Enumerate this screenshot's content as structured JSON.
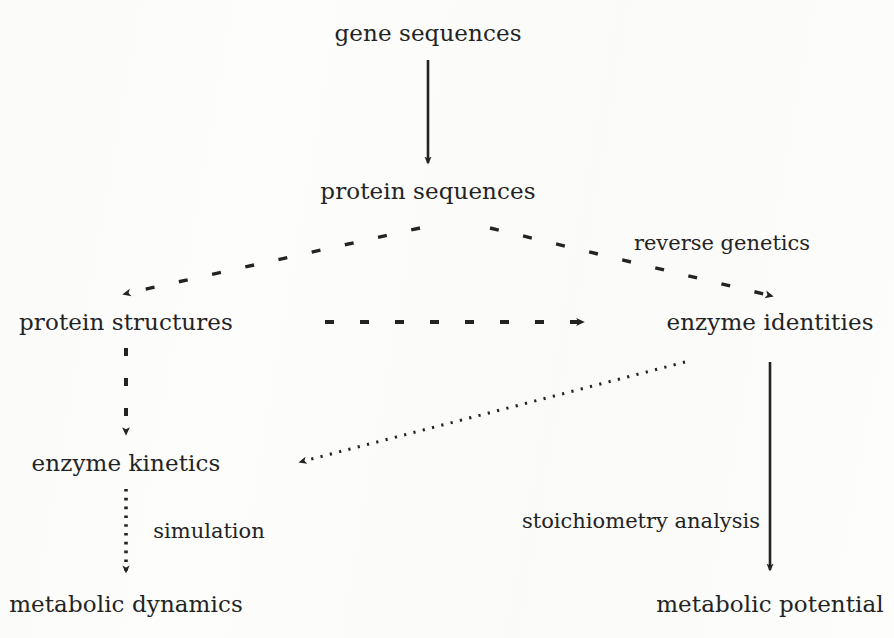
{
  "diagram": {
    "background_color": "#fdfdfc",
    "ink_color": "#232323",
    "nodes": [
      {
        "id": "gene_sequences",
        "label": "gene sequences",
        "x": 428,
        "y": 33
      },
      {
        "id": "protein_sequences",
        "label": "protein sequences",
        "x": 428,
        "y": 191
      },
      {
        "id": "protein_structures",
        "label": "protein structures",
        "x": 126,
        "y": 322
      },
      {
        "id": "enzyme_identities",
        "label": "enzyme identities",
        "x": 770,
        "y": 322
      },
      {
        "id": "enzyme_kinetics",
        "label": "enzyme kinetics",
        "x": 126,
        "y": 463
      },
      {
        "id": "metabolic_dynamics",
        "label": "metabolic dynamics",
        "x": 126,
        "y": 604
      },
      {
        "id": "metabolic_potential",
        "label": "metabolic potential",
        "x": 770,
        "y": 604
      }
    ],
    "edge_labels": [
      {
        "id": "reverse_genetics",
        "label": "reverse genetics",
        "x": 722,
        "y": 243
      },
      {
        "id": "simulation",
        "label": "simulation",
        "x": 209,
        "y": 531
      },
      {
        "id": "stoichiometry_analysis",
        "label": "stoichiometry analysis",
        "x": 641,
        "y": 521
      }
    ],
    "edges": [
      {
        "id": "gene-to-protein",
        "from": "gene_sequences",
        "to": "protein_sequences",
        "style": "solid"
      },
      {
        "id": "protein-to-structures",
        "from": "protein_sequences",
        "to": "protein_structures",
        "style": "dashed"
      },
      {
        "id": "protein-to-enzymes",
        "from": "protein_sequences",
        "to": "enzyme_identities",
        "style": "dashed"
      },
      {
        "id": "structures-to-enzymes",
        "from": "protein_structures",
        "to": "enzyme_identities",
        "style": "dashed"
      },
      {
        "id": "structures-to-kinetics",
        "from": "protein_structures",
        "to": "enzyme_kinetics",
        "style": "dashed"
      },
      {
        "id": "enzymes-to-kinetics",
        "from": "enzyme_identities",
        "to": "enzyme_kinetics",
        "style": "dotted"
      },
      {
        "id": "kinetics-to-dynamics",
        "from": "enzyme_kinetics",
        "to": "metabolic_dynamics",
        "style": "dotted"
      },
      {
        "id": "enzymes-to-potential",
        "from": "enzyme_identities",
        "to": "metabolic_potential",
        "style": "solid"
      }
    ]
  }
}
